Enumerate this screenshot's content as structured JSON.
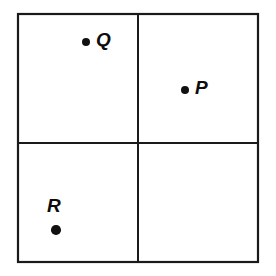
{
  "figure": {
    "background_color": "#ffffff",
    "line_color": "#1a1a1a",
    "dot_color": "#111111",
    "label_color": "#0d0d0d",
    "frame": {
      "left": 18,
      "top": 14,
      "right": 258,
      "bottom": 262,
      "stroke_width": 2.2
    },
    "dividers": {
      "vertical_x": 138,
      "horizontal_y": 143,
      "stroke_width": 2.0
    },
    "quadrants": [
      {
        "name": "top-left",
        "occupant": "Q"
      },
      {
        "name": "top-right",
        "occupant": "P"
      },
      {
        "name": "bottom-left",
        "occupant": "R"
      },
      {
        "name": "bottom-right",
        "occupant": ""
      }
    ],
    "points": [
      {
        "label": "Q",
        "quadrant": "top-left",
        "dot_x": 86,
        "dot_y": 42,
        "dot_radius": 4.4,
        "label_x": 96,
        "label_y": 30,
        "label_position": "right",
        "font_size": 19
      },
      {
        "label": "P",
        "quadrant": "top-right",
        "dot_x": 185,
        "dot_y": 90,
        "dot_radius": 4.4,
        "label_x": 195,
        "label_y": 78,
        "label_position": "right",
        "font_size": 19
      },
      {
        "label": "R",
        "quadrant": "bottom-left",
        "dot_x": 56,
        "dot_y": 230,
        "dot_radius": 4.8,
        "label_x": 47,
        "label_y": 196,
        "label_position": "above",
        "font_size": 19
      }
    ]
  }
}
